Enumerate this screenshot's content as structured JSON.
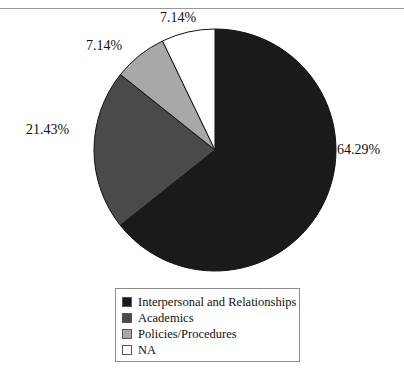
{
  "figure": {
    "caption_fragment": "",
    "top_rule": true
  },
  "chart_data": {
    "type": "pie",
    "title": "",
    "xlabel": "",
    "ylabel": "",
    "legend_position": "bottom",
    "grid": false,
    "start_angle_deg": 0,
    "direction": "clockwise",
    "total_n": 14,
    "categories": [
      "Interpersonal and Relationships",
      "Academics",
      "Policies/Procedures",
      "NA"
    ],
    "values": [
      64.29,
      21.43,
      7.14,
      7.14
    ],
    "value_unit": "percent",
    "counts": [
      9,
      3,
      1,
      1
    ],
    "colors": [
      "#1a1a1a",
      "#4a4a4a",
      "#a8a8a8",
      "#ffffff"
    ],
    "labels": [
      "64.29%",
      "21.43%",
      "7.14%",
      "7.14%"
    ],
    "slices": [
      {
        "name": "Interpersonal and Relationships",
        "value": 64.29,
        "label": "64.29%",
        "color": "#1a1a1a",
        "start_deg": 0,
        "end_deg": 231.444
      },
      {
        "name": "Academics",
        "value": 21.43,
        "label": "21.43%",
        "color": "#4a4a4a",
        "start_deg": 231.444,
        "end_deg": 308.592
      },
      {
        "name": "Policies/Procedures",
        "value": 7.14,
        "label": "7.14%",
        "color": "#a8a8a8",
        "start_deg": 308.592,
        "end_deg": 334.296
      },
      {
        "name": "NA",
        "value": 7.14,
        "label": "7.14%",
        "color": "#ffffff",
        "start_deg": 334.296,
        "end_deg": 360
      }
    ]
  },
  "labels": {
    "interpersonal_pct": "64.29%",
    "academics_pct": "21.43%",
    "policies_pct": "7.14%",
    "na_pct": "7.14%"
  },
  "legend": {
    "items": [
      {
        "label": "Interpersonal and Relationships",
        "color": "#1a1a1a"
      },
      {
        "label": "Academics",
        "color": "#4a4a4a"
      },
      {
        "label": "Policies/Procedures",
        "color": "#a8a8a8"
      },
      {
        "label": "NA",
        "color": "#ffffff"
      }
    ]
  }
}
